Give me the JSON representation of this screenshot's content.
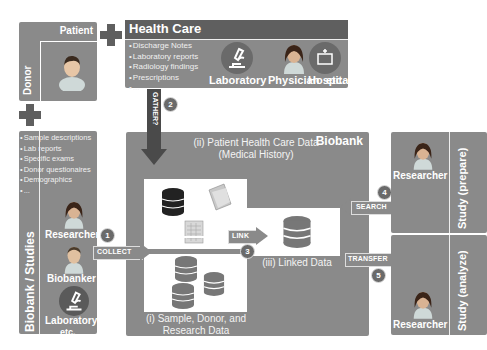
{
  "patient_panel": {
    "title": "Patient",
    "side_label": "Donor",
    "icon": "person-avatar-icon"
  },
  "health_care": {
    "title": "Health Care",
    "bullets": [
      "Discharge Notes",
      "Laboratory reports",
      "Radiology findings",
      "Prescriptions",
      "..."
    ],
    "icons": [
      {
        "label": "Laboratory",
        "icon": "microscope-icon"
      },
      {
        "label": "Physician",
        "icon": "physician-avatar-icon"
      },
      {
        "label": "Hospital",
        "icon": "hospital-icon"
      }
    ],
    "etc": "etc."
  },
  "biobank_studies": {
    "side_label": "Biobank / Studies",
    "bullets": [
      "Sample descriptions",
      "Lab reports",
      "Specific exams",
      "Donor questionaires",
      "Demographics",
      "..."
    ],
    "actors": [
      {
        "label": "Researcher",
        "icon": "researcher-avatar-icon"
      },
      {
        "label": "Biobanker",
        "icon": "biobanker-avatar-icon"
      },
      {
        "label": "Laboratory",
        "icon": "microscope-icon"
      }
    ],
    "etc": "etc."
  },
  "biobank": {
    "title": "Biobank",
    "patient_data": {
      "caption_line1": "(ii) Patient Health Care Data",
      "caption_line2": "(Medical History)"
    },
    "sample_data": {
      "caption_line1": "(i) Sample, Donor, and",
      "caption_line2": "Research Data"
    },
    "linked_data": {
      "caption": "(iii) Linked Data"
    }
  },
  "study_prepare": {
    "side_label": "Study (prepare)",
    "actor": "Researcher"
  },
  "study_analyze": {
    "side_label": "Study (analyze)",
    "actor": "Researcher"
  },
  "arrows": {
    "gather": {
      "label": "GATHER?",
      "step": "2"
    },
    "collect": {
      "label": "COLLECT",
      "step": "1"
    },
    "link": {
      "label": "LINK",
      "step": "3"
    },
    "search": {
      "label": "SEARCH",
      "step": "4"
    },
    "transfer": {
      "label": "TRANSFER",
      "step": "5"
    }
  },
  "colors": {
    "panel_gray": "#8a8a8a",
    "panel_dark": "#5f5f5f",
    "white": "#ffffff"
  }
}
